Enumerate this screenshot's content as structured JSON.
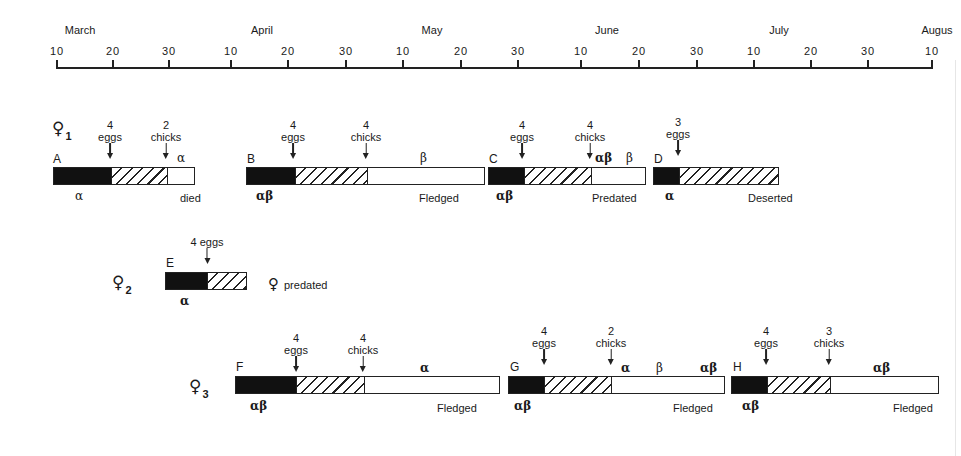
{
  "timeline": {
    "months": [
      {
        "label": "March",
        "x": 80
      },
      {
        "label": "April",
        "x": 262
      },
      {
        "label": "May",
        "x": 432
      },
      {
        "label": "June",
        "x": 607
      },
      {
        "label": "July",
        "x": 779
      },
      {
        "label": "Augus",
        "x": 937
      }
    ],
    "ticks": [
      {
        "label": "10",
        "x": 56
      },
      {
        "label": "20",
        "x": 112
      },
      {
        "label": "30",
        "x": 168
      },
      {
        "label": "10",
        "x": 230
      },
      {
        "label": "20",
        "x": 287
      },
      {
        "label": "30",
        "x": 345
      },
      {
        "label": "10",
        "x": 402
      },
      {
        "label": "20",
        "x": 460
      },
      {
        "label": "30",
        "x": 517
      },
      {
        "label": "10",
        "x": 580
      },
      {
        "label": "20",
        "x": 638
      },
      {
        "label": "30",
        "x": 696
      },
      {
        "label": "10",
        "x": 753
      },
      {
        "label": "20",
        "x": 810
      },
      {
        "label": "30",
        "x": 867
      },
      {
        "label": "10",
        "x": 931
      }
    ]
  },
  "females": [
    {
      "symbol": "♀",
      "sub": "1",
      "x": 52,
      "y": 118
    },
    {
      "symbol": "♀",
      "sub": "2",
      "x": 112,
      "y": 272
    },
    {
      "symbol": "♀",
      "sub": "3",
      "x": 189,
      "y": 376
    }
  ],
  "nests": [
    {
      "id": "A",
      "female": 1,
      "bar": {
        "x": 53,
        "y": 167,
        "black": 57,
        "hatch": 56,
        "white": 29
      },
      "letter": {
        "text": "A",
        "x": 53,
        "y": 152
      },
      "markers": [
        {
          "count": "4",
          "text": "eggs",
          "x": 110,
          "y": 119
        },
        {
          "count": "2",
          "text": "chicks",
          "x": 166,
          "y": 119
        }
      ],
      "above_labels": [
        {
          "text": "α",
          "x": 177,
          "y": 151,
          "bold": false
        }
      ],
      "below_labels": [
        {
          "text": "α",
          "x": 75,
          "y": 189,
          "bold": false,
          "greek": true
        },
        {
          "text": "died",
          "x": 180,
          "y": 192,
          "greek": false
        }
      ],
      "outcome": "died"
    },
    {
      "id": "B",
      "female": 1,
      "bar": {
        "x": 246,
        "y": 167,
        "black": 48,
        "hatch": 72,
        "white": 119
      },
      "letter": {
        "text": "B",
        "x": 247,
        "y": 152
      },
      "markers": [
        {
          "count": "4",
          "text": "eggs",
          "x": 293,
          "y": 119
        },
        {
          "count": "4",
          "text": "chicks",
          "x": 366,
          "y": 119
        }
      ],
      "above_labels": [
        {
          "text": "β",
          "x": 420,
          "y": 151,
          "bold": false
        }
      ],
      "below_labels": [
        {
          "text": "αβ",
          "x": 256,
          "y": 189,
          "bold": true,
          "greek": true
        },
        {
          "text": "Fledged",
          "x": 419,
          "y": 192,
          "greek": false
        }
      ],
      "outcome": "Fledged"
    },
    {
      "id": "C",
      "female": 1,
      "bar": {
        "x": 488,
        "y": 167,
        "black": 35,
        "hatch": 67,
        "white": 56
      },
      "letter": {
        "text": "C",
        "x": 489,
        "y": 152
      },
      "markers": [
        {
          "count": "4",
          "text": "eggs",
          "x": 522,
          "y": 119
        },
        {
          "count": "4",
          "text": "chicks",
          "x": 590,
          "y": 119
        }
      ],
      "above_labels": [
        {
          "text": "αβ",
          "x": 595,
          "y": 151,
          "bold": true
        },
        {
          "text": "β",
          "x": 626,
          "y": 151,
          "bold": false
        }
      ],
      "below_labels": [
        {
          "text": "αβ",
          "x": 496,
          "y": 189,
          "bold": true,
          "greek": true
        },
        {
          "text": "Predated",
          "x": 592,
          "y": 192,
          "greek": false
        }
      ],
      "outcome": "Predated"
    },
    {
      "id": "D",
      "female": 1,
      "bar": {
        "x": 653,
        "y": 167,
        "black": 25,
        "hatch": 101,
        "white": 0
      },
      "letter": {
        "text": "D",
        "x": 654,
        "y": 152
      },
      "markers": [
        {
          "count": "3",
          "text": "eggs",
          "x": 678,
          "y": 116
        }
      ],
      "above_labels": [],
      "below_labels": [
        {
          "text": "α",
          "x": 665,
          "y": 189,
          "bold": true,
          "greek": true
        },
        {
          "text": "Deserted",
          "x": 748,
          "y": 192,
          "greek": false
        }
      ],
      "outcome": "Deserted"
    },
    {
      "id": "E",
      "female": 2,
      "bar": {
        "x": 165,
        "y": 272,
        "black": 42,
        "hatch": 40,
        "white": 0
      },
      "letter": {
        "text": "E",
        "x": 166,
        "y": 256
      },
      "markers": [
        {
          "count": "4 eggs",
          "text": "",
          "x": 207,
          "y": 236
        }
      ],
      "above_labels": [],
      "below_labels": [
        {
          "text": "α",
          "x": 180,
          "y": 294,
          "bold": true,
          "greek": true
        }
      ],
      "side_label": {
        "symbol": "♀",
        "text": "predated",
        "x": 268,
        "y": 275
      },
      "outcome": "♀ predated"
    },
    {
      "id": "F",
      "female": 3,
      "bar": {
        "x": 235,
        "y": 376,
        "black": 60,
        "hatch": 68,
        "white": 137
      },
      "letter": {
        "text": "F",
        "x": 236,
        "y": 360
      },
      "markers": [
        {
          "count": "4",
          "text": "eggs",
          "x": 296,
          "y": 332
        },
        {
          "count": "4",
          "text": "chicks",
          "x": 363,
          "y": 332
        }
      ],
      "above_labels": [
        {
          "text": "α",
          "x": 420,
          "y": 361,
          "bold": true
        }
      ],
      "below_labels": [
        {
          "text": "αβ",
          "x": 250,
          "y": 399,
          "bold": true,
          "greek": true
        },
        {
          "text": "Fledged",
          "x": 437,
          "y": 402,
          "greek": false
        }
      ],
      "outcome": "Fledged"
    },
    {
      "id": "G",
      "female": 3,
      "bar": {
        "x": 508,
        "y": 376,
        "black": 35,
        "hatch": 67,
        "white": 115
      },
      "letter": {
        "text": "G",
        "x": 510,
        "y": 360
      },
      "markers": [
        {
          "count": "4",
          "text": "eggs",
          "x": 544,
          "y": 325
        },
        {
          "count": "2",
          "text": "chicks",
          "x": 611,
          "y": 325
        }
      ],
      "above_labels": [
        {
          "text": "α",
          "x": 621,
          "y": 361,
          "bold": true
        },
        {
          "text": "β",
          "x": 656,
          "y": 361,
          "bold": false
        },
        {
          "text": "αβ",
          "x": 700,
          "y": 361,
          "bold": true
        }
      ],
      "below_labels": [
        {
          "text": "αβ",
          "x": 514,
          "y": 399,
          "bold": true,
          "greek": true
        },
        {
          "text": "Fledged",
          "x": 673,
          "y": 402,
          "greek": false
        }
      ],
      "outcome": "Fledged"
    },
    {
      "id": "H",
      "female": 3,
      "bar": {
        "x": 731,
        "y": 376,
        "black": 35,
        "hatch": 63,
        "white": 110
      },
      "letter": {
        "text": "H",
        "x": 733,
        "y": 360
      },
      "markers": [
        {
          "count": "4",
          "text": "eggs",
          "x": 766,
          "y": 325
        },
        {
          "count": "3",
          "text": "chicks",
          "x": 829,
          "y": 325
        }
      ],
      "above_labels": [
        {
          "text": "αβ",
          "x": 873,
          "y": 361,
          "bold": true
        }
      ],
      "below_labels": [
        {
          "text": "αβ",
          "x": 742,
          "y": 399,
          "bold": true,
          "greek": true
        },
        {
          "text": "Fledged",
          "x": 893,
          "y": 402,
          "greek": false
        }
      ],
      "outcome": "Fledged"
    }
  ]
}
